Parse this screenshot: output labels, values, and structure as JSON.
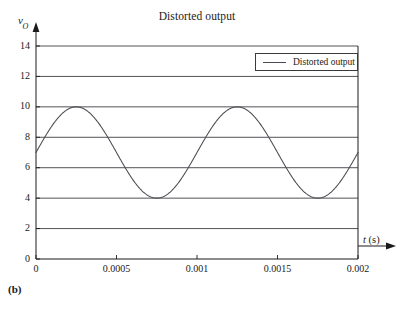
{
  "figure": {
    "caption": "(b)"
  },
  "chart_data": {
    "type": "line",
    "title": "Distorted output",
    "xlabel": "t (s)",
    "ylabel": "vO",
    "ylabel_base": "v",
    "ylabel_sub": "O",
    "xlim": [
      0,
      0.002
    ],
    "ylim": [
      0,
      14
    ],
    "grid": "horizontal",
    "legend_position": "top-right",
    "xticks": [
      0,
      0.0005,
      0.001,
      0.0015,
      0.002
    ],
    "xtick_labels": [
      "0",
      "0.0005",
      "0.001",
      "0.0015",
      "0.002"
    ],
    "yticks": [
      0,
      2,
      4,
      6,
      8,
      10,
      12,
      14
    ],
    "ytick_labels": [
      "0",
      "2",
      "4",
      "6",
      "8",
      "10",
      "12",
      "14"
    ],
    "gridline_values": [
      2,
      4,
      6,
      8,
      10,
      12,
      14
    ],
    "series": [
      {
        "name": "Distorted output",
        "color": "#4a4a52",
        "form": "sine",
        "dc_offset": 7,
        "amplitude": 3,
        "period": 0.001,
        "phase": 0,
        "peak_value": 10,
        "trough_value": 4,
        "start_value": 6,
        "end_value": 6,
        "cycles": 2,
        "peak_times": [
          0.00025,
          0.00125
        ],
        "trough_times": [
          0.00075,
          0.00175
        ],
        "x": [
          0,
          6.25e-05,
          0.000125,
          0.0001875,
          0.00025,
          0.0003125,
          0.000375,
          0.0004375,
          0.0005,
          0.0005625,
          0.000625,
          0.0006875,
          0.00075,
          0.0008125,
          0.000875,
          0.0009375,
          0.001,
          0.0010625,
          0.001125,
          0.0011875,
          0.00125,
          0.0013125,
          0.001375,
          0.0014375,
          0.0015,
          0.0015625,
          0.001625,
          0.0016875,
          0.00175,
          0.0018125,
          0.001875,
          0.0019375,
          0.002
        ],
        "y": [
          7.0,
          8.15,
          9.12,
          9.77,
          10.0,
          9.77,
          9.12,
          8.15,
          7.0,
          5.85,
          4.88,
          4.23,
          4.0,
          4.23,
          4.88,
          5.85,
          7.0,
          8.15,
          9.12,
          9.77,
          10.0,
          9.77,
          9.12,
          8.15,
          7.0,
          5.85,
          4.88,
          4.23,
          4.0,
          4.23,
          4.88,
          5.85,
          7.0
        ]
      }
    ]
  },
  "legend": {
    "entries": [
      {
        "label": "Distorted output"
      }
    ]
  }
}
